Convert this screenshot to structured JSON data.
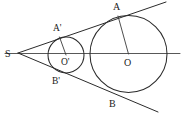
{
  "figure": {
    "background_color": "#ffffff",
    "line_color": "#2b2b2b",
    "axis_color": "#585858",
    "width": 185,
    "height": 115
  },
  "labels": {
    "S": "S",
    "A": "A",
    "B": "B",
    "A_prime": "A'",
    "B_prime": "B'",
    "O": "O",
    "O_prime": "O'"
  },
  "points": {
    "S": {
      "x": 18,
      "y": 53,
      "label_x": 5,
      "label_y": 57
    },
    "A": {
      "x": 118,
      "y": 16,
      "label_x": 113,
      "label_y": 10
    },
    "B": {
      "x": 112,
      "y": 92,
      "label_x": 109,
      "label_y": 107
    },
    "A_prime": {
      "x": 59.5,
      "y": 37,
      "label_x": 53,
      "label_y": 31
    },
    "B_prime": {
      "x": 59.5,
      "y": 72,
      "label_x": 52,
      "label_y": 84
    },
    "O": {
      "x": 128.5,
      "y": 54,
      "label_x": 124,
      "label_y": 66
    },
    "O_prime": {
      "x": 66,
      "y": 55,
      "label_x": 61,
      "label_y": 65
    }
  },
  "circles": {
    "large": {
      "cx": 128.5,
      "cy": 54,
      "r": 38.5,
      "name": "circle-O"
    },
    "small": {
      "cx": 66,
      "cy": 55,
      "r": 18,
      "name": "circle-O-prime"
    }
  },
  "lines": {
    "center_axis": {
      "x1": 5,
      "y1": 53.5,
      "x2": 180,
      "y2": 53.5
    },
    "upper_tangent": {
      "x1": 18,
      "y1": 53,
      "x2": 166,
      "y2": 2
    },
    "lower_tangent": {
      "x1": 18,
      "y1": 53,
      "x2": 158,
      "y2": 112
    },
    "radius_O_to_A": {
      "x1": 128.5,
      "y1": 54,
      "x2": 118,
      "y2": 16
    },
    "radius_Oprime_to_Aprime": {
      "x1": 66,
      "y1": 55,
      "x2": 59.5,
      "y2": 37
    }
  }
}
